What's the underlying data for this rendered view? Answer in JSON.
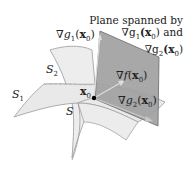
{
  "diagram": {
    "caption": {
      "line1": "Plane spanned by",
      "line2_prefix": "∇g",
      "line2_sub": "1",
      "line2_arg": "(x",
      "line2_arg_sub": "0",
      "line2_suffix": ") and",
      "line3_prefix": "∇g",
      "line3_sub": "2",
      "line3_arg": "(x",
      "line3_arg_sub": "0",
      "line3_suffix": ")"
    },
    "labels": {
      "grad_g1": {
        "nabla": "∇",
        "fn": "g",
        "sub": "1",
        "open": "(",
        "x": "x",
        "xsub": "0",
        "close": ")"
      },
      "grad_f": {
        "nabla": "∇",
        "fn": "f",
        "open": "(",
        "x": "x",
        "xsub": "0",
        "close": ")"
      },
      "grad_g2": {
        "nabla": "∇",
        "fn": "g",
        "sub": "2",
        "open": "(",
        "x": "x",
        "xsub": "0",
        "close": ")"
      },
      "point": {
        "x": "x",
        "xsub": "0"
      },
      "S1": {
        "name": "S",
        "sub": "1"
      },
      "S2": {
        "name": "S",
        "sub": "2"
      },
      "S": {
        "name": "S"
      }
    },
    "colors": {
      "surface_fill": "#ececec",
      "surface_stroke": "#9a9a9a",
      "plane_fill": "#9c9c9c",
      "plane_stroke": "#6a6a6a",
      "vector": "#d8d8d8",
      "point": "#000000"
    }
  }
}
